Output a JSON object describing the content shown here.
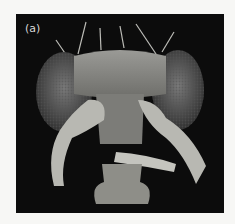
{
  "figure": {
    "panel_label": "(a)",
    "background_color": "#0c0c0c",
    "page_color": "#f7f7f5"
  }
}
